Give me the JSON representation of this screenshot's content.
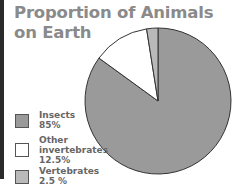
{
  "title_line1": "Proportion of Animals",
  "title_line2": "on Earth",
  "chart_data": {
    "type": "pie",
    "title": "Proportion of Animals on Earth",
    "categories": [
      "Insects",
      "Other invertebrates",
      "Vertebrates"
    ],
    "values": [
      85,
      12.5,
      2.5
    ],
    "colors": [
      "#9a9a9a",
      "#ffffff",
      "#b9b9b9"
    ],
    "legend_position": "left"
  },
  "legend": [
    {
      "name": "Insects",
      "value": "85%",
      "color": "#9a9a9a"
    },
    {
      "name": "Other\ninvertebrates",
      "value": "12.5%",
      "color": "#ffffff"
    },
    {
      "name": "Vertebrates",
      "value": "2.5 %",
      "color": "#b9b9b9"
    }
  ]
}
